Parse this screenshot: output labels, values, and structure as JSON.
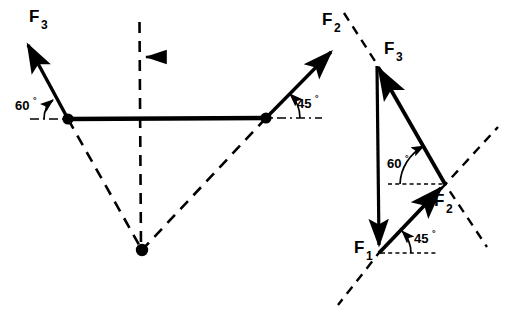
{
  "figure": {
    "background_color": "#ffffff",
    "stroke_color": "#000000",
    "width": 506,
    "height": 317
  },
  "left_diagram": {
    "name": "space-diagram",
    "description": "Two cables attached to a horizontal member, with a suspended load at the apex below",
    "labels": {
      "f3": "F",
      "f3_sub": "3",
      "f2": "F",
      "f2_sub": "2",
      "angle_left": "60",
      "angle_left_sup": "°",
      "angle_right": "45",
      "angle_right_sup": "°"
    },
    "joints": [
      {
        "name": "left-joint",
        "x": 68,
        "y": 119
      },
      {
        "name": "right-joint",
        "x": 266,
        "y": 118
      },
      {
        "name": "apex-load-point",
        "x": 142,
        "y": 250
      }
    ],
    "members": [
      {
        "name": "horizontal-member",
        "x1": 68,
        "y1": 119,
        "x2": 266,
        "y2": 118,
        "style": "solid"
      },
      {
        "name": "f3-vector",
        "x1": 68,
        "y1": 119,
        "x2": 25,
        "y2": 40,
        "style": "solid-arrow"
      },
      {
        "name": "f2-vector",
        "x1": 266,
        "y1": 118,
        "x2": 335,
        "y2": 48,
        "style": "solid-arrow"
      },
      {
        "name": "left-cable",
        "x1": 68,
        "y1": 119,
        "x2": 142,
        "y2": 250,
        "style": "dashed"
      },
      {
        "name": "right-cable",
        "x1": 266,
        "y1": 118,
        "x2": 142,
        "y2": 250,
        "style": "dashed"
      },
      {
        "name": "vertical-centerline",
        "x1": 139,
        "y1": 22,
        "x2": 140,
        "y2": 250,
        "style": "dashed"
      }
    ],
    "reference_lines": [
      {
        "name": "left-horizontal-reference",
        "x1": 30,
        "y1": 119,
        "x2": 78,
        "y2": 119
      },
      {
        "name": "right-horizontal-reference",
        "x1": 262,
        "y1": 118,
        "x2": 320,
        "y2": 118
      }
    ],
    "load_arrow": {
      "name": "load-direction-arrow",
      "x1": 163,
      "y1": 57,
      "x2": 143,
      "y2": 57,
      "direction": "left"
    }
  },
  "right_diagram": {
    "name": "force-triangle-diagram",
    "description": "Closed force triangle of the three concurrent forces F1, F2, F3",
    "labels": {
      "f3": "F",
      "f3_sub": "3",
      "f2": "F",
      "f2_sub": "2",
      "f1": "F",
      "f1_sub": "1",
      "angle_60": "60",
      "angle_60_sup": "°",
      "angle_45": "45",
      "angle_45_sup": "°"
    },
    "vertices": [
      {
        "name": "f3-apex",
        "x": 375,
        "y": 62
      },
      {
        "name": "f2-vertex",
        "x": 445,
        "y": 184
      },
      {
        "name": "f1-base",
        "x": 379,
        "y": 253
      }
    ],
    "vectors": [
      {
        "name": "f1-vector",
        "x1": 377,
        "y1": 66,
        "x2": 379,
        "y2": 252,
        "style": "solid-arrow",
        "direction": "down"
      },
      {
        "name": "f3-vector",
        "x1": 445,
        "y1": 184,
        "x2": 376,
        "y2": 63,
        "style": "solid-arrow",
        "direction": "up-left"
      },
      {
        "name": "f2-vector",
        "x1": 379,
        "y1": 253,
        "x2": 446,
        "y2": 183,
        "style": "solid-arrow",
        "direction": "up-right"
      }
    ],
    "construction_lines": [
      {
        "name": "dashed-line-through-f3",
        "x1": 344,
        "y1": 14,
        "x2": 390,
        "y2": 84,
        "style": "dashed"
      },
      {
        "name": "dashed-line-upper-right",
        "x1": 445,
        "y1": 184,
        "x2": 497,
        "y2": 128,
        "style": "dashed"
      },
      {
        "name": "dashed-line-lower-right",
        "x1": 445,
        "y1": 184,
        "x2": 486,
        "y2": 245,
        "style": "dashed"
      },
      {
        "name": "dashed-line-lower-left",
        "x1": 379,
        "y1": 253,
        "x2": 340,
        "y2": 303,
        "style": "dashed"
      }
    ],
    "reference_lines": [
      {
        "name": "f2-horizontal-reference",
        "x1": 389,
        "y1": 184,
        "x2": 447,
        "y2": 184
      },
      {
        "name": "f1-horizontal-reference",
        "x1": 381,
        "y1": 253,
        "x2": 434,
        "y2": 253
      }
    ]
  }
}
